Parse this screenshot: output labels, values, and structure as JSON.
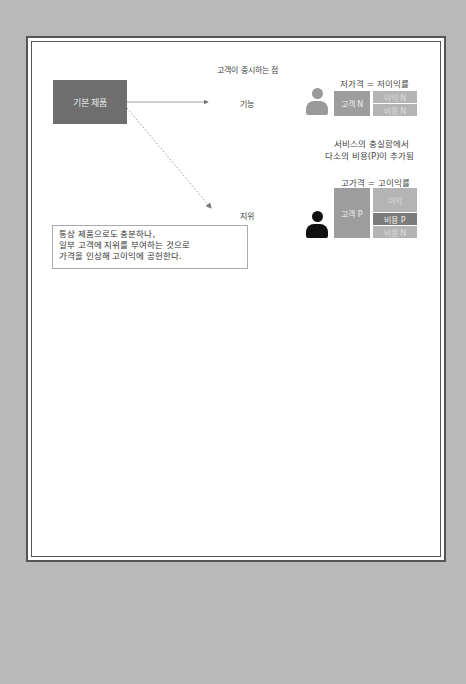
{
  "diagram": {
    "header": "고객이 중시하는 점",
    "base_product": "기본 제품",
    "attributes": [
      {
        "label": "기능",
        "arrow_style": "solid"
      },
      {
        "label": "지위",
        "arrow_style": "dotted"
      }
    ],
    "low_price": {
      "title": "저가격 = 저이익률",
      "customer": "고객 N",
      "stack": [
        "이익 N",
        "비용 N"
      ]
    },
    "service_note": {
      "line1": "서비스의 충실함에서",
      "line2": "다소의 비용(P)이 추가됨"
    },
    "high_price": {
      "title": "고가격 = 고이익률",
      "customer": "고객 P",
      "stack": [
        "이익",
        "비용 P",
        "비용 N"
      ]
    },
    "note": {
      "line1": "통상 제품으로도 충분하나,",
      "line2": "일부 고객에 지위를 부여하는 것으로",
      "line3": "가격을 인상해 고이익에 공헌한다."
    },
    "icons": [
      "person-icon-gray",
      "person-icon-black"
    ],
    "colors": {
      "background": "#b9b9b9",
      "base_box": "#6e6e6e",
      "customer_box": "#9d9d9d",
      "cost_p": "#7b7b7b",
      "person_gray": "#9a9a9a",
      "person_black": "#111111"
    }
  }
}
